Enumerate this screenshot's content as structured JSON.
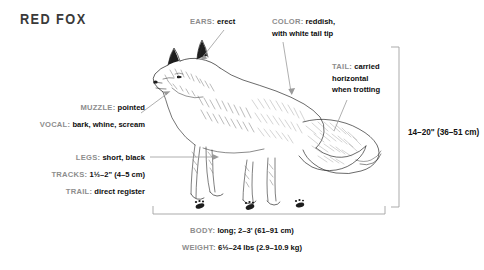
{
  "page": {
    "title": "RED FOX",
    "background_color": "#ffffff",
    "label_color": "#8d8d8d",
    "value_color": "#0d0d0d",
    "leader_color": "#9a9a9a",
    "illustration": "red-fox-side-view-line-engraving"
  },
  "callouts": [
    {
      "id": "ears",
      "label": "EARS:",
      "value": "erect",
      "lines": [
        {
          "label": "EARS:",
          "value": "erect"
        }
      ]
    },
    {
      "id": "color",
      "label": "COLOR:",
      "value": "reddish, with white tail tip",
      "lines": [
        {
          "label": "COLOR:",
          "value": "reddish,"
        },
        {
          "label": "",
          "value": "with white tail tip"
        }
      ]
    },
    {
      "id": "tail",
      "label": "TAIL:",
      "value": "carried horizontal when trotting",
      "lines": [
        {
          "label": "TAIL:",
          "value": "carried"
        },
        {
          "label": "",
          "value": "horizontal"
        },
        {
          "label": "",
          "value": "when trotting"
        }
      ]
    },
    {
      "id": "muzzle",
      "label": "MUZZLE:",
      "value": "pointed",
      "lines": [
        {
          "label": "MUZZLE:",
          "value": "pointed"
        }
      ]
    },
    {
      "id": "vocal",
      "label": "VOCAL:",
      "value": "bark, whine, scream",
      "lines": [
        {
          "label": "VOCAL:",
          "value": "bark, whine, scream"
        }
      ]
    },
    {
      "id": "legs",
      "label": "LEGS:",
      "value": "short, black",
      "lines": [
        {
          "label": "LEGS:",
          "value": "short, black"
        }
      ]
    },
    {
      "id": "tracks",
      "label": "TRACKS:",
      "value": "1½–2\" (4–5 cm)",
      "lines": [
        {
          "label": "TRACKS:",
          "value": "1½–2\" (4–5 cm)"
        }
      ]
    },
    {
      "id": "trail",
      "label": "TRAIL:",
      "value": "direct register",
      "lines": [
        {
          "label": "TRAIL:",
          "value": "direct register"
        }
      ]
    },
    {
      "id": "body",
      "label": "BODY:",
      "value": "long; 2–3' (61–91 cm)",
      "lines": [
        {
          "label": "BODY:",
          "value": "long; 2–3' (61–91 cm)"
        }
      ]
    },
    {
      "id": "weight",
      "label": "WEIGHT:",
      "value": "6½–24 lbs (2.9–10.9 kg)",
      "lines": [
        {
          "label": "WEIGHT:",
          "value": "6½–24 lbs (2.9–10.9 kg)"
        }
      ]
    }
  ],
  "callout_text": {
    "ears_label": "EARS:",
    "ears_value": "erect",
    "color_label": "COLOR:",
    "color_value_1": "reddish,",
    "color_value_2": "with white tail tip",
    "tail_label": "TAIL:",
    "tail_value_1": "carried",
    "tail_value_2": "horizontal",
    "tail_value_3": "when trotting",
    "muzzle_label": "MUZZLE:",
    "muzzle_value": "pointed",
    "vocal_label": "VOCAL:",
    "vocal_value": "bark, whine, scream",
    "legs_label": "LEGS:",
    "legs_value": "short, black",
    "tracks_label": "TRACKS:",
    "tracks_value": "1½–2\" (4–5 cm)",
    "trail_label": "TRAIL:",
    "trail_value": "direct register",
    "body_label": "BODY:",
    "body_value": "long; 2–3' (61–91 cm)",
    "weight_label": "WEIGHT:",
    "weight_value": "6½–24 lbs (2.9–10.9 kg)"
  },
  "dimensions": {
    "height_imperial": "14–20\"",
    "height_metric": "(36–51 cm)"
  }
}
